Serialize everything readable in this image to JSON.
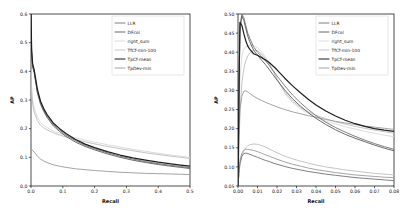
{
  "figure": {
    "background": "#ffffff",
    "panel_count": 2
  },
  "series_style": [
    {
      "name": "LLR",
      "color": "#707070",
      "width": 0.9
    },
    {
      "name": "DFcol",
      "color": "#5a5a5a",
      "width": 0.9
    },
    {
      "name": "right_sum",
      "color": "#d8d8d8",
      "width": 0.9
    },
    {
      "name": "TfCf-min-100",
      "color": "#bdbdbd",
      "width": 0.9
    },
    {
      "name": "TpCf-mean",
      "color": "#1c1c1c",
      "width": 1.2
    },
    {
      "name": "TpDev-min",
      "color": "#9a9a9a",
      "width": 0.9
    }
  ],
  "chart_data": [
    {
      "type": "line",
      "panel": "left",
      "title": "",
      "xlabel": "Recall",
      "ylabel": "AP",
      "xlim": [
        0.0,
        0.5
      ],
      "ylim": [
        0.0,
        0.6
      ],
      "xticks": [
        0.0,
        0.1,
        0.2,
        0.3,
        0.4,
        0.5
      ],
      "xtick_labels": [
        "0.0",
        "0.1",
        "0.2",
        "0.3",
        "0.4",
        "0.5"
      ],
      "yticks": [
        0.0,
        0.1,
        0.2,
        0.3,
        0.4,
        0.5,
        0.6
      ],
      "ytick_labels": [
        "0.0",
        "0.1",
        "0.2",
        "0.3",
        "0.4",
        "0.5",
        "0.6"
      ],
      "grid": false,
      "legend_position": "upper right",
      "legend_entries": [
        "LLR",
        "DFcol",
        "right_sum",
        "TfCf-min-100",
        "TpCf-mean",
        "TpDev-min"
      ],
      "x": [
        0.0,
        0.002,
        0.005,
        0.01,
        0.02,
        0.03,
        0.04,
        0.05,
        0.07,
        0.09,
        0.11,
        0.14,
        0.17,
        0.2,
        0.24,
        0.28,
        0.32,
        0.36,
        0.4,
        0.44,
        0.47,
        0.5
      ],
      "series": [
        {
          "name": "LLR",
          "values": [
            0.6,
            0.47,
            0.42,
            0.4,
            0.33,
            0.29,
            0.265,
            0.245,
            0.215,
            0.195,
            0.178,
            0.158,
            0.142,
            0.13,
            0.116,
            0.104,
            0.094,
            0.085,
            0.078,
            0.072,
            0.068,
            0.064
          ]
        },
        {
          "name": "DFcol",
          "values": [
            0.6,
            0.46,
            0.415,
            0.395,
            0.325,
            0.285,
            0.26,
            0.24,
            0.21,
            0.19,
            0.173,
            0.153,
            0.138,
            0.126,
            0.112,
            0.1,
            0.09,
            0.082,
            0.075,
            0.069,
            0.065,
            0.061
          ]
        },
        {
          "name": "right_sum",
          "values": [
            0.405,
            0.345,
            0.3,
            0.272,
            0.24,
            0.222,
            0.212,
            0.204,
            0.192,
            0.184,
            0.177,
            0.168,
            0.16,
            0.153,
            0.144,
            0.136,
            0.128,
            0.121,
            0.114,
            0.108,
            0.104,
            0.1
          ]
        },
        {
          "name": "TfCf-min-100",
          "values": [
            0.405,
            0.33,
            0.285,
            0.258,
            0.228,
            0.212,
            0.203,
            0.196,
            0.186,
            0.178,
            0.171,
            0.162,
            0.154,
            0.147,
            0.138,
            0.13,
            0.123,
            0.116,
            0.11,
            0.104,
            0.1,
            0.096
          ]
        },
        {
          "name": "TpCf-mean",
          "values": [
            0.6,
            0.475,
            0.428,
            0.405,
            0.338,
            0.296,
            0.27,
            0.25,
            0.22,
            0.2,
            0.183,
            0.162,
            0.146,
            0.134,
            0.12,
            0.108,
            0.098,
            0.09,
            0.083,
            0.077,
            0.073,
            0.069
          ]
        },
        {
          "name": "TpDev-min",
          "values": [
            0.13,
            0.128,
            0.124,
            0.118,
            0.104,
            0.094,
            0.087,
            0.082,
            0.074,
            0.069,
            0.065,
            0.06,
            0.057,
            0.054,
            0.051,
            0.048,
            0.046,
            0.044,
            0.043,
            0.042,
            0.041,
            0.04
          ]
        }
      ]
    },
    {
      "type": "line",
      "panel": "right",
      "title": "",
      "xlabel": "Recall",
      "ylabel": "AP",
      "xlim": [
        0.0,
        0.08
      ],
      "ylim": [
        0.05,
        0.5
      ],
      "xticks": [
        0.0,
        0.01,
        0.02,
        0.03,
        0.04,
        0.05,
        0.06,
        0.07,
        0.08
      ],
      "xtick_labels": [
        "0.00",
        "0.01",
        "0.02",
        "0.03",
        "0.04",
        "0.05",
        "0.06",
        "0.07",
        "0.08"
      ],
      "yticks": [
        0.05,
        0.1,
        0.15,
        0.2,
        0.25,
        0.3,
        0.35,
        0.4,
        0.45,
        0.5
      ],
      "ytick_labels": [
        "0.05",
        "0.10",
        "0.15",
        "0.20",
        "0.25",
        "0.30",
        "0.35",
        "0.40",
        "0.45",
        "0.50"
      ],
      "grid": false,
      "legend_position": "upper right",
      "legend_entries": [
        "LLR",
        "DFcol",
        "right_sum",
        "TfCf-min-100",
        "TpCf-mean",
        "TpDev-min"
      ],
      "x": [
        0.0,
        0.0005,
        0.001,
        0.002,
        0.003,
        0.004,
        0.005,
        0.006,
        0.008,
        0.01,
        0.012,
        0.014,
        0.016,
        0.018,
        0.02,
        0.024,
        0.028,
        0.032,
        0.036,
        0.04,
        0.045,
        0.05,
        0.055,
        0.06,
        0.065,
        0.07,
        0.075,
        0.08
      ],
      "series": [
        {
          "name": "LLR",
          "values": [
            0.05,
            0.3,
            0.47,
            0.5,
            0.49,
            0.47,
            0.45,
            0.437,
            0.414,
            0.4,
            0.39,
            0.378,
            0.366,
            0.352,
            0.338,
            0.312,
            0.288,
            0.268,
            0.25,
            0.234,
            0.217,
            0.203,
            0.191,
            0.18,
            0.17,
            0.161,
            0.153,
            0.146
          ]
        },
        {
          "name": "DFcol",
          "values": [
            0.05,
            0.29,
            0.455,
            0.495,
            0.483,
            0.462,
            0.442,
            0.428,
            0.405,
            0.392,
            0.38,
            0.368,
            0.355,
            0.341,
            0.327,
            0.301,
            0.278,
            0.259,
            0.242,
            0.227,
            0.211,
            0.197,
            0.185,
            0.175,
            0.166,
            0.157,
            0.149,
            0.142
          ]
        },
        {
          "name": "right_sum",
          "values": [
            0.05,
            0.2,
            0.33,
            0.392,
            0.408,
            0.414,
            0.417,
            0.418,
            0.417,
            0.412,
            0.402,
            0.388,
            0.372,
            0.352,
            0.33,
            0.292,
            0.268,
            0.252,
            0.24,
            0.23,
            0.22,
            0.212,
            0.205,
            0.199,
            0.193,
            0.188,
            0.183,
            0.179
          ]
        },
        {
          "name": "TfCf-min-100",
          "values": [
            0.05,
            0.15,
            0.24,
            0.32,
            0.358,
            0.378,
            0.39,
            0.398,
            0.405,
            0.404,
            0.396,
            0.384,
            0.368,
            0.35,
            0.33,
            0.296,
            0.272,
            0.256,
            0.244,
            0.235,
            0.226,
            0.218,
            0.212,
            0.206,
            0.201,
            0.196,
            0.192,
            0.188
          ]
        },
        {
          "name": "TpCf-mean",
          "values": [
            0.05,
            0.31,
            0.478,
            0.47,
            0.448,
            0.43,
            0.416,
            0.408,
            0.396,
            0.392,
            0.386,
            0.38,
            0.373,
            0.364,
            0.354,
            0.332,
            0.312,
            0.294,
            0.277,
            0.262,
            0.246,
            0.233,
            0.222,
            0.213,
            0.206,
            0.2,
            0.196,
            0.193
          ]
        },
        {
          "name": "TpDev-min",
          "values": [
            0.05,
            0.18,
            0.25,
            0.285,
            0.298,
            0.299,
            0.296,
            0.292,
            0.285,
            0.279,
            0.274,
            0.269,
            0.265,
            0.261,
            0.257,
            0.25,
            0.244,
            0.239,
            0.234,
            0.23,
            0.224,
            0.219,
            0.215,
            0.211,
            0.207,
            0.204,
            0.201,
            0.198
          ]
        }
      ],
      "extra_series": [
        {
          "name": "TpDev-min-low",
          "style_ref": "TpDev-min",
          "values": [
            0.05,
            0.09,
            0.118,
            0.136,
            0.144,
            0.146,
            0.146,
            0.145,
            0.143,
            0.14,
            0.136,
            0.132,
            0.128,
            0.124,
            0.12,
            0.113,
            0.107,
            0.102,
            0.097,
            0.093,
            0.089,
            0.085,
            0.082,
            0.079,
            0.077,
            0.075,
            0.073,
            0.072
          ]
        },
        {
          "name": "TfCf-min-100-low",
          "style_ref": "TfCf-min-100",
          "values": [
            0.05,
            0.08,
            0.105,
            0.128,
            0.142,
            0.15,
            0.155,
            0.158,
            0.16,
            0.159,
            0.156,
            0.152,
            0.147,
            0.142,
            0.137,
            0.128,
            0.121,
            0.115,
            0.11,
            0.105,
            0.1,
            0.096,
            0.092,
            0.089,
            0.086,
            0.083,
            0.081,
            0.079
          ]
        },
        {
          "name": "LLR-low",
          "style_ref": "LLR",
          "values": [
            0.05,
            0.085,
            0.11,
            0.128,
            0.135,
            0.136,
            0.135,
            0.133,
            0.129,
            0.125,
            0.121,
            0.117,
            0.114,
            0.11,
            0.107,
            0.101,
            0.096,
            0.092,
            0.088,
            0.085,
            0.081,
            0.078,
            0.075,
            0.072,
            0.07,
            0.068,
            0.066,
            0.064
          ]
        }
      ]
    }
  ]
}
